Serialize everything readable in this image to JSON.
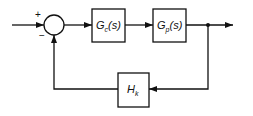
{
  "diagram": {
    "type": "feedback-control-block-diagram",
    "summing_junction": {
      "plus_sign": "+",
      "minus_sign": "−"
    },
    "blocks": [
      {
        "id": "controller",
        "label_main": "G",
        "label_sub": "c",
        "label_suffix": "(s)"
      },
      {
        "id": "plant",
        "label_main": "G",
        "label_sub": "p",
        "label_suffix": "(s)"
      },
      {
        "id": "feedback",
        "label_main": "H",
        "label_sub": "k",
        "label_suffix": ""
      }
    ],
    "colors": {
      "line": "#111111",
      "background": "#ffffff"
    }
  }
}
